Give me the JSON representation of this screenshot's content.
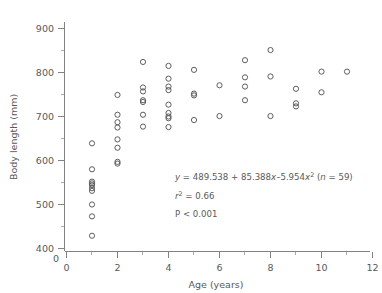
{
  "chart_data": {
    "type": "scatter",
    "title": "",
    "xlabel": "Age (years)",
    "ylabel": "Body length (mm)",
    "xlim": [
      0,
      12
    ],
    "ylim": [
      400,
      900
    ],
    "y_axis_break_label": "0",
    "grid": false,
    "legend": null,
    "x_ticks_major": [
      0,
      2,
      4,
      6,
      8,
      10,
      12
    ],
    "x_ticks_minor": [
      1,
      3,
      5,
      7,
      9,
      11
    ],
    "y_ticks_major": [
      400,
      500,
      600,
      700,
      800,
      900
    ],
    "y_ticks_minor": [
      450,
      550,
      650,
      750,
      850
    ],
    "marker": "open-circle",
    "marker_color": "#4d4d4f",
    "n_points": 59,
    "points": [
      {
        "x": 1,
        "y": 639
      },
      {
        "x": 1,
        "y": 580
      },
      {
        "x": 1,
        "y": 552
      },
      {
        "x": 1,
        "y": 548
      },
      {
        "x": 1,
        "y": 544
      },
      {
        "x": 1,
        "y": 537
      },
      {
        "x": 1,
        "y": 531
      },
      {
        "x": 1,
        "y": 500
      },
      {
        "x": 1,
        "y": 473
      },
      {
        "x": 1,
        "y": 429
      },
      {
        "x": 2,
        "y": 749
      },
      {
        "x": 2,
        "y": 704
      },
      {
        "x": 2,
        "y": 687
      },
      {
        "x": 2,
        "y": 675
      },
      {
        "x": 2,
        "y": 648
      },
      {
        "x": 2,
        "y": 629
      },
      {
        "x": 2,
        "y": 597
      },
      {
        "x": 2,
        "y": 593
      },
      {
        "x": 3,
        "y": 824
      },
      {
        "x": 3,
        "y": 766
      },
      {
        "x": 3,
        "y": 757
      },
      {
        "x": 3,
        "y": 737
      },
      {
        "x": 3,
        "y": 733
      },
      {
        "x": 3,
        "y": 704
      },
      {
        "x": 3,
        "y": 677
      },
      {
        "x": 4,
        "y": 815
      },
      {
        "x": 4,
        "y": 786
      },
      {
        "x": 4,
        "y": 768
      },
      {
        "x": 4,
        "y": 760
      },
      {
        "x": 4,
        "y": 727
      },
      {
        "x": 4,
        "y": 708
      },
      {
        "x": 4,
        "y": 700
      },
      {
        "x": 4,
        "y": 696
      },
      {
        "x": 4,
        "y": 676
      },
      {
        "x": 5,
        "y": 806
      },
      {
        "x": 5,
        "y": 752
      },
      {
        "x": 5,
        "y": 748
      },
      {
        "x": 5,
        "y": 692
      },
      {
        "x": 6,
        "y": 771
      },
      {
        "x": 6,
        "y": 701
      },
      {
        "x": 7,
        "y": 828
      },
      {
        "x": 7,
        "y": 789
      },
      {
        "x": 7,
        "y": 768
      },
      {
        "x": 7,
        "y": 737
      },
      {
        "x": 8,
        "y": 851
      },
      {
        "x": 8,
        "y": 791
      },
      {
        "x": 8,
        "y": 701
      },
      {
        "x": 9,
        "y": 763
      },
      {
        "x": 9,
        "y": 730
      },
      {
        "x": 9,
        "y": 723
      },
      {
        "x": 10,
        "y": 802
      },
      {
        "x": 10,
        "y": 755
      },
      {
        "x": 11,
        "y": 802
      }
    ],
    "annotations": {
      "equation_prefix": "y",
      "equation_body": " = 489.538 + 85.388",
      "equation_x1": "x",
      "equation_mid": "–5.954",
      "equation_x2": "x",
      "equation_exp": "2",
      "equation_n_open": " (",
      "equation_n_var": "n",
      "equation_n_val": " = 59)",
      "r2_var": "r",
      "r2_exp": "2",
      "r2_value": " = 0.66",
      "p_value": "P < 0.001"
    }
  }
}
